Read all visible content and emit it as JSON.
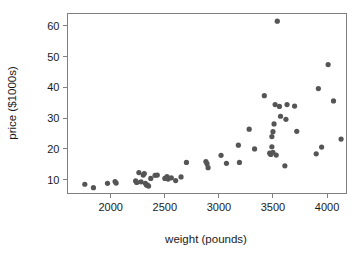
{
  "chart_data": {
    "type": "scatter",
    "title": "",
    "xlabel": "weight (pounds)",
    "ylabel": "price ($1000s)",
    "xlim": [
      1600,
      4180
    ],
    "ylim": [
      5.5,
      64
    ],
    "xticks": [
      2000,
      2500,
      3000,
      3500,
      4000
    ],
    "yticks": [
      10,
      20,
      30,
      40,
      50,
      60
    ],
    "xtick_labels": [
      "2000",
      "2500",
      "3000",
      "3500",
      "4000"
    ],
    "ytick_labels": [
      "10",
      "20",
      "30",
      "40",
      "50",
      "60"
    ],
    "grid": false,
    "legend": null,
    "marker_color": "#555555",
    "marker_size": 2.6,
    "frame_color": "#808080",
    "points": [
      {
        "x": 1760,
        "y": 8.5
      },
      {
        "x": 1840,
        "y": 7.4
      },
      {
        "x": 1970,
        "y": 8.8
      },
      {
        "x": 2040,
        "y": 9.4
      },
      {
        "x": 2050,
        "y": 8.9
      },
      {
        "x": 2230,
        "y": 9.6
      },
      {
        "x": 2240,
        "y": 9.1
      },
      {
        "x": 2260,
        "y": 12.3
      },
      {
        "x": 2280,
        "y": 9.3
      },
      {
        "x": 2300,
        "y": 11.5
      },
      {
        "x": 2310,
        "y": 12.0
      },
      {
        "x": 2320,
        "y": 8.8
      },
      {
        "x": 2330,
        "y": 8.3
      },
      {
        "x": 2340,
        "y": 8.2
      },
      {
        "x": 2350,
        "y": 7.9
      },
      {
        "x": 2370,
        "y": 10.4
      },
      {
        "x": 2410,
        "y": 11.4
      },
      {
        "x": 2430,
        "y": 11.5
      },
      {
        "x": 2500,
        "y": 10.4
      },
      {
        "x": 2520,
        "y": 11.0
      },
      {
        "x": 2530,
        "y": 10.2
      },
      {
        "x": 2560,
        "y": 10.6
      },
      {
        "x": 2600,
        "y": 9.7
      },
      {
        "x": 2650,
        "y": 10.9
      },
      {
        "x": 2700,
        "y": 15.6
      },
      {
        "x": 2880,
        "y": 15.9
      },
      {
        "x": 2890,
        "y": 15.2
      },
      {
        "x": 2900,
        "y": 13.9
      },
      {
        "x": 3020,
        "y": 17.9
      },
      {
        "x": 3070,
        "y": 15.3
      },
      {
        "x": 3180,
        "y": 21.2
      },
      {
        "x": 3190,
        "y": 15.6
      },
      {
        "x": 3280,
        "y": 26.4
      },
      {
        "x": 3330,
        "y": 20.0
      },
      {
        "x": 3420,
        "y": 37.3
      },
      {
        "x": 3470,
        "y": 18.6
      },
      {
        "x": 3480,
        "y": 18.2
      },
      {
        "x": 3490,
        "y": 20.7
      },
      {
        "x": 3490,
        "y": 24.0
      },
      {
        "x": 3500,
        "y": 18.9
      },
      {
        "x": 3500,
        "y": 25.6
      },
      {
        "x": 3510,
        "y": 28.1
      },
      {
        "x": 3520,
        "y": 34.4
      },
      {
        "x": 3530,
        "y": 18.0
      },
      {
        "x": 3540,
        "y": 61.5
      },
      {
        "x": 3560,
        "y": 33.8
      },
      {
        "x": 3570,
        "y": 30.6
      },
      {
        "x": 3610,
        "y": 14.5
      },
      {
        "x": 3620,
        "y": 29.6
      },
      {
        "x": 3630,
        "y": 34.4
      },
      {
        "x": 3700,
        "y": 33.9
      },
      {
        "x": 3720,
        "y": 25.7
      },
      {
        "x": 3900,
        "y": 18.4
      },
      {
        "x": 3920,
        "y": 39.6
      },
      {
        "x": 3950,
        "y": 20.6
      },
      {
        "x": 4010,
        "y": 47.4
      },
      {
        "x": 4060,
        "y": 35.6
      },
      {
        "x": 4130,
        "y": 23.2
      }
    ]
  }
}
